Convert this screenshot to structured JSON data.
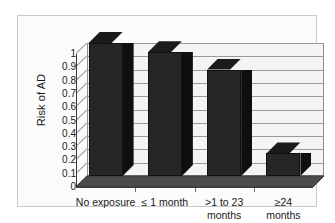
{
  "chart_data": {
    "type": "bar",
    "title": "",
    "subtitle": "",
    "xlabel": "",
    "ylabel": "Risk of AD",
    "categories": [
      "No exposure",
      "≤ 1 month",
      ">1 to 23 months",
      "≥24 months"
    ],
    "category_lines": [
      [
        "No exposure"
      ],
      [
        "≤ 1 month"
      ],
      [
        ">1 to 23",
        "months"
      ],
      [
        "≥24",
        "months"
      ]
    ],
    "values": [
      1.0,
      0.93,
      0.8,
      0.17
    ],
    "ylim": [
      0,
      1
    ],
    "ytick_labels": [
      "0",
      "0.1",
      "0.2",
      "0.3",
      "0.4",
      "0.5",
      "0.6",
      "0.7",
      "0.8",
      "0.9",
      "1"
    ],
    "ytick_values": [
      0,
      0.1,
      0.2,
      0.3,
      0.4,
      0.5,
      0.6,
      0.7,
      0.8,
      0.9,
      1
    ],
    "grid": true,
    "grid_axis": "y",
    "legend": false,
    "legend_position": "none",
    "style": "3d-column",
    "colors": {
      "bar_front": "#262626",
      "bar_top": "#1b1b1b",
      "bar_side": "#0f0f0f",
      "plot_background": "#f4f4f4",
      "floor": "#4a4a4a",
      "gridline": "#9a9a9a",
      "axis": "#3a3a3a",
      "frame_border": "#c9c9c9",
      "figure_background": "#ffffff",
      "text": "#1a1a1a"
    }
  }
}
